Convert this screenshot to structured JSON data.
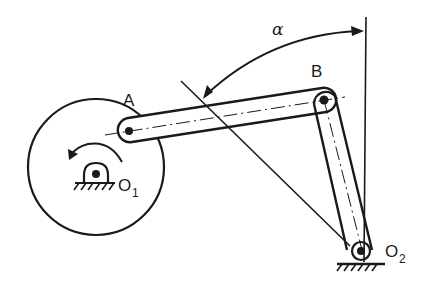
{
  "diagram": {
    "type": "four-bar linkage (crank-rocker) mechanism",
    "labels": {
      "point_a": "A",
      "point_b": "B",
      "pivot_o1": "O",
      "pivot_o1_sub": "1",
      "pivot_o2": "O",
      "pivot_o2_sub": "2",
      "angle": "α"
    },
    "colors": {
      "ink": "#1a1a1a",
      "background": "#ffffff"
    },
    "components": [
      "crank-disc",
      "coupler-link-AB",
      "rocker-link-BO2",
      "ground-pivot-O1",
      "ground-pivot-O2",
      "vertical-reference-line",
      "angle-arc-alpha",
      "rotation-direction-arrow"
    ]
  }
}
